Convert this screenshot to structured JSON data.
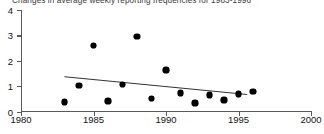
{
  "chart_data": {
    "type": "scatter",
    "title": "Changes in average weekly reporting frequencies for 1983-1996",
    "xlabel": "",
    "ylabel": "",
    "xlim": [
      1980,
      2000
    ],
    "ylim": [
      0,
      4
    ],
    "xticks": [
      1980,
      1985,
      1990,
      1995,
      2000
    ],
    "xtick_labels": [
      "1980",
      "1985",
      "1990",
      "1995",
      "2000"
    ],
    "yticks": [
      0,
      1,
      2,
      3,
      4
    ],
    "ytick_labels": [
      "0",
      "1",
      "2",
      "3",
      "4"
    ],
    "grid": false,
    "legend": null,
    "marker": "filled-diamond",
    "series": [
      {
        "name": "Average weekly reporting frequency",
        "x": [
          1983,
          1984,
          1985,
          1986,
          1987,
          1988,
          1989,
          1990,
          1991,
          1992,
          1993,
          1994,
          1995,
          1996
        ],
        "values": [
          0.38,
          1.03,
          2.6,
          0.42,
          1.07,
          2.95,
          0.51,
          1.64,
          0.74,
          0.33,
          0.65,
          0.46,
          0.69,
          0.79
        ]
      }
    ],
    "trendline": {
      "name": "linear fit",
      "x": [
        1983,
        1995.6
      ],
      "y": [
        1.37,
        0.67
      ]
    }
  },
  "axis": {
    "y_labels": [
      "4",
      "3",
      "2",
      "1",
      "0"
    ],
    "x_labels": [
      "1980",
      "1985",
      "1990",
      "1995",
      "2000"
    ]
  }
}
